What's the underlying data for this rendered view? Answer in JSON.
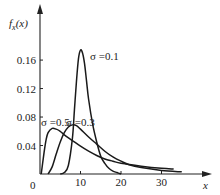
{
  "chart_data": {
    "type": "line",
    "title": "",
    "ylabel": "f_x(x)",
    "xlabel": "x",
    "xlim": [
      0,
      35
    ],
    "ylim": [
      0,
      0.19
    ],
    "x_ticks": [
      0,
      10,
      20,
      30
    ],
    "x_tick_labels": [
      "0",
      "10",
      "20",
      "30"
    ],
    "y_ticks": [
      0.04,
      0.08,
      0.12,
      0.16
    ],
    "y_tick_labels": [
      "0.04",
      "0.08",
      "0.12",
      "0.16"
    ],
    "grid": false,
    "legend": "inline labels near curves",
    "series": [
      {
        "name": "σ =0.1",
        "x": [
          5,
          6,
          7,
          8,
          8.5,
          9,
          9.5,
          10,
          10.5,
          11,
          11.5,
          12,
          13,
          14,
          15,
          16,
          17,
          18,
          19,
          20
        ],
        "values": [
          0.0,
          0.002,
          0.012,
          0.05,
          0.09,
          0.13,
          0.162,
          0.174,
          0.17,
          0.155,
          0.13,
          0.105,
          0.07,
          0.045,
          0.025,
          0.015,
          0.008,
          0.004,
          0.002,
          0.0
        ]
      },
      {
        "name": "σ =0.3",
        "x": [
          2,
          3,
          4,
          5,
          6,
          7,
          8,
          9,
          10,
          12,
          14,
          16,
          18,
          20,
          22,
          25,
          30,
          35
        ],
        "values": [
          0.0,
          0.01,
          0.028,
          0.045,
          0.058,
          0.066,
          0.069,
          0.068,
          0.063,
          0.052,
          0.042,
          0.032,
          0.024,
          0.018,
          0.013,
          0.009,
          0.005,
          0.003
        ]
      },
      {
        "name": "σ =0.5",
        "x": [
          0.3,
          1,
          1.5,
          2,
          3,
          4,
          5,
          6,
          8,
          10,
          12,
          14,
          16,
          18,
          20,
          25,
          30,
          33
        ],
        "values": [
          0.0,
          0.03,
          0.048,
          0.058,
          0.064,
          0.063,
          0.06,
          0.055,
          0.047,
          0.039,
          0.032,
          0.026,
          0.021,
          0.018,
          0.015,
          0.011,
          0.008,
          0.007
        ]
      }
    ],
    "annotations": [
      "σ =0.1",
      "σ =0.5",
      "σ =0.3"
    ]
  },
  "labels": {
    "y_axis": "f",
    "y_axis_sub": "x",
    "y_axis_arg": "(x)",
    "x_axis": "x",
    "origin": "0",
    "ann_01": "σ =0.1",
    "ann_05": "σ =0.5",
    "ann_03": "σ =0.3"
  }
}
